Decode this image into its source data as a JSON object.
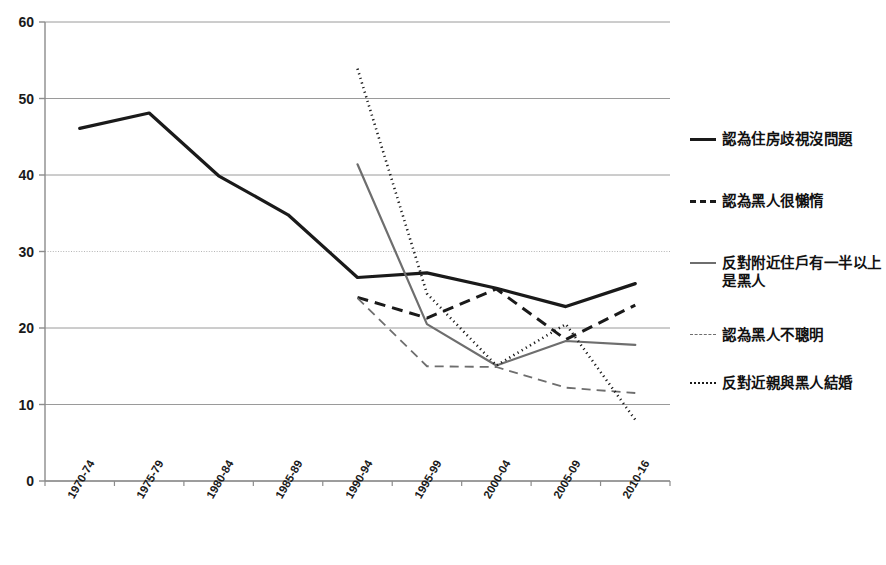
{
  "chart_data": {
    "type": "line",
    "title": "",
    "xlabel": "",
    "ylabel": "",
    "ylim": [
      0,
      60
    ],
    "yticks": [
      0,
      10,
      20,
      30,
      40,
      50,
      60
    ],
    "grid": true,
    "legend_position": "right",
    "categories": [
      "1970-74",
      "1975-79",
      "1980-84",
      "1985-89",
      "1990-94",
      "1995-99",
      "2000-04",
      "2005-09",
      "2010-16"
    ],
    "series": [
      {
        "name": "認為住房歧視沒問題",
        "style": "solid-thick",
        "color": "#1a1a1a",
        "values": [
          46.1,
          48.1,
          39.9,
          34.8,
          26.6,
          27.2,
          25.2,
          22.8,
          25.8
        ]
      },
      {
        "name": "認為黑人很懶惰",
        "style": "dashed-thick",
        "color": "#1a1a1a",
        "values": [
          null,
          null,
          null,
          null,
          24.0,
          21.3,
          25.1,
          18.5,
          23.0
        ]
      },
      {
        "name": "反對附近住戶有一半以上是黑人",
        "style": "solid-gray",
        "color": "#6e6e6e",
        "values": [
          null,
          null,
          null,
          null,
          41.4,
          20.5,
          15.1,
          18.3,
          17.8
        ]
      },
      {
        "name": "認為黑人不聰明",
        "style": "dashed-gray",
        "color": "#6e6e6e",
        "values": [
          null,
          null,
          null,
          null,
          23.9,
          15.0,
          14.9,
          12.2,
          11.5
        ]
      },
      {
        "name": "反對近親與黑人結婚",
        "style": "dotted",
        "color": "#1a1a1a",
        "values": [
          null,
          null,
          null,
          null,
          53.9,
          24.5,
          15.1,
          20.5,
          8.0
        ]
      }
    ]
  },
  "legend": {
    "entries": [
      {
        "label": "認為住房歧視沒問題",
        "style": "sw-solid-thick"
      },
      {
        "label": "認為黑人很懶惰",
        "style": "sw-dash-thick"
      },
      {
        "label": "反對附近住戶有一半以上是黑人",
        "style": "sw-solid-gray"
      },
      {
        "label": "認為黑人不聰明",
        "style": "sw-dash-gray"
      },
      {
        "label": "反對近親與黑人結婚",
        "style": "sw-dotted"
      }
    ]
  },
  "axis": {
    "y_tick_labels": [
      "60",
      "50",
      "40",
      "30",
      "20",
      "10",
      "0"
    ],
    "x_tick_labels": [
      "1970-74",
      "1975-79",
      "1980-84",
      "1985-89",
      "1990-94",
      "1995-99",
      "2000-04",
      "2005-09",
      "2010-16"
    ]
  },
  "colors": {
    "primary_line": "#1a1a1a",
    "secondary_line": "#6e6e6e",
    "grid": "#9a9a9a",
    "axis": "#8c8c8c",
    "background": "#ffffff"
  }
}
